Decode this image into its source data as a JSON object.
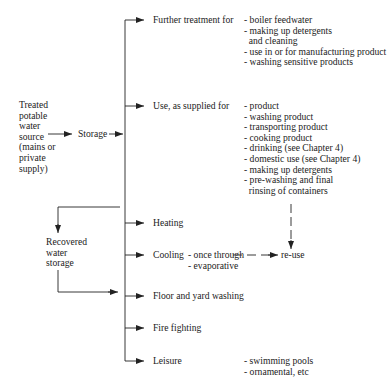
{
  "source": {
    "lines": [
      "Treated",
      "potable",
      "water",
      "source",
      "(mains or",
      "private",
      "supply)"
    ]
  },
  "storage_label": "Storage",
  "recovered": {
    "lines": [
      "Recovered",
      "water",
      "storage"
    ]
  },
  "branches": [
    {
      "label": "Further treatment for",
      "items": [
        "- boiler feedwater",
        "- making up detergents",
        "  and cleaning",
        "- use in or for manufacturing product",
        "- washing sensitive products"
      ]
    },
    {
      "label": "Use, as supplied for",
      "items": [
        "- product",
        "- washing product",
        "- transporting product",
        "- cooking product",
        "- drinking (see Chapter 4)",
        "- domestic use (see Chapter 4)",
        "- making up detergents",
        "- pre-washing and final",
        "  rinsing of containers"
      ]
    },
    {
      "label": "Heating",
      "items": []
    },
    {
      "label": "Cooling",
      "items": [
        "- once through",
        "- evaporative"
      ]
    },
    {
      "label": "Floor and yard washing",
      "items": []
    },
    {
      "label": "Fire fighting",
      "items": []
    },
    {
      "label": "Leisure",
      "items": [
        "- swimming pools",
        "- ornamental, etc"
      ]
    }
  ],
  "reuse_label": "re-use",
  "colors": {
    "line": "#222222",
    "text": "#222222"
  }
}
